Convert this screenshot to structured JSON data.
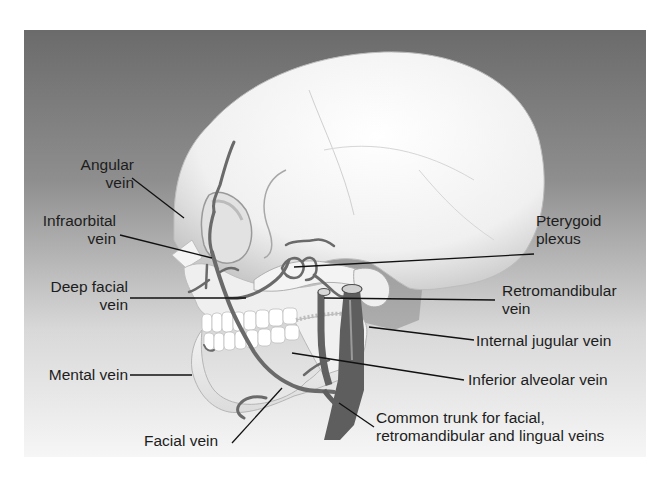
{
  "figure": {
    "background_gradient": {
      "top": "#6e6e6e",
      "bottom": "#f4f4f4"
    },
    "colors": {
      "vein": "#6d6d6d",
      "vein_dark": "#5a5a5a",
      "bone": "#f2f2f2",
      "leader": "#111111",
      "text": "#1d1d1d"
    }
  },
  "labels": {
    "angular": {
      "line1": "Angular",
      "line2": "vein"
    },
    "infraorbital": {
      "line1": "Infraorbital",
      "line2": "vein"
    },
    "deep_facial": {
      "line1": "Deep facial",
      "line2": "vein"
    },
    "mental": {
      "line1": "Mental vein"
    },
    "facial": {
      "line1": "Facial vein"
    },
    "pterygoid": {
      "line1": "Pterygoid",
      "line2": "plexus"
    },
    "retromandibular": {
      "line1": "Retromandibular",
      "line2": "vein"
    },
    "internal_jugular": {
      "line1": "Internal jugular vein"
    },
    "inferior_alveolar": {
      "line1": "Inferior alveolar vein"
    },
    "common_trunk": {
      "line1": "Common trunk for facial,",
      "line2": "retromandibular and lingual veins"
    }
  }
}
